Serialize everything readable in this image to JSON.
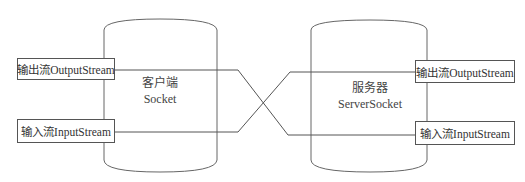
{
  "diagram": {
    "client": {
      "title": "客户端",
      "subtitle": "Socket",
      "output_stream": "输出流OutputStream",
      "input_stream": "输入流InputStream"
    },
    "server": {
      "title": "服务器",
      "subtitle": "ServerSocket",
      "output_stream": "输出流OutputStream",
      "input_stream": "输入流InputStream"
    },
    "colors": {
      "line": "#555555",
      "background": "#ffffff"
    }
  }
}
